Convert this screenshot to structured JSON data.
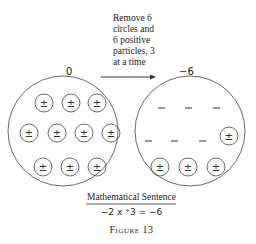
{
  "instruction": {
    "lines": [
      "Remove 6",
      "circles and",
      "6 positive",
      "particles, 3",
      "at a time"
    ]
  },
  "left_circle": {
    "label": "0",
    "particle_symbol": "±",
    "particle_count": 10
  },
  "right_circle": {
    "label": "−6",
    "negative_count": 6,
    "particle_symbol": "±",
    "particle_count": 4,
    "negative_symbol": "–"
  },
  "caption": {
    "heading": "Mathematical Sentence",
    "equation": "−2 x ⁺3 = −6",
    "figure": "Figure 13"
  }
}
